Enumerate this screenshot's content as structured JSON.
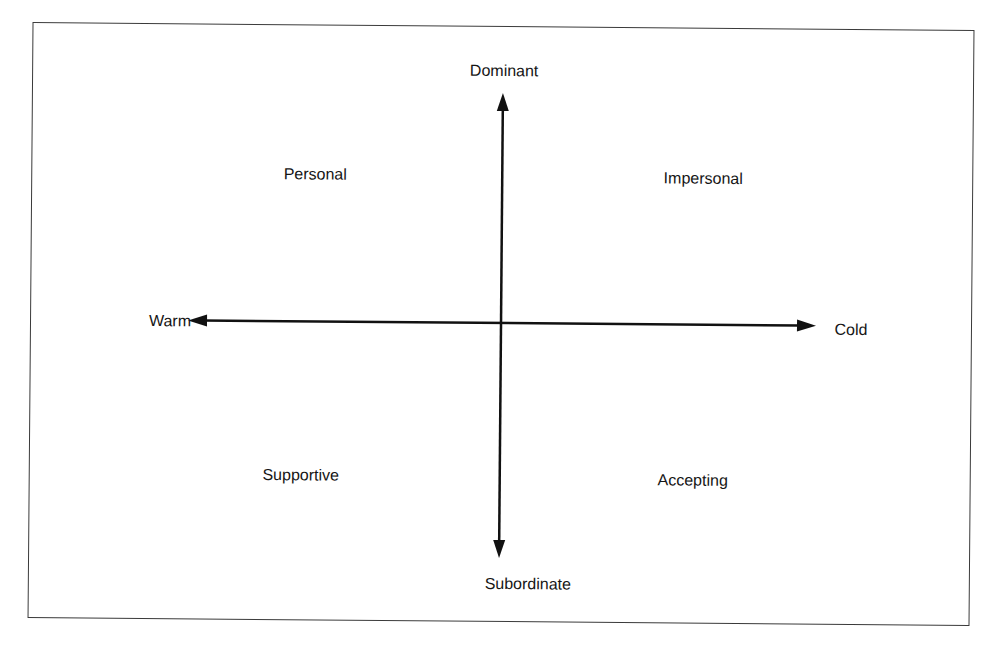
{
  "diagram": {
    "type": "quadrant",
    "axes": {
      "vertical": {
        "top_label": "Dominant",
        "bottom_label": "Subordinate"
      },
      "horizontal": {
        "left_label": "Warm",
        "right_label": "Cold"
      }
    },
    "quadrants": {
      "top_left": "Personal",
      "top_right": "Impersonal",
      "bottom_left": "Supportive",
      "bottom_right": "Accepting"
    },
    "colors": {
      "line": "#111111",
      "frame": "#3a3a3a",
      "text": "#151515",
      "background": "#ffffff"
    }
  }
}
